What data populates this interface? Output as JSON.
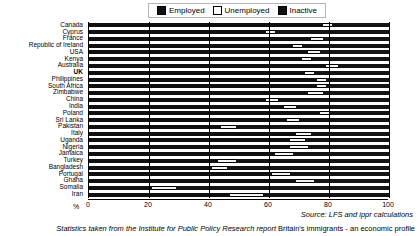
{
  "legend": {
    "entries": [
      {
        "label": "Employed",
        "color": "#101010",
        "key": "employed"
      },
      {
        "label": "Unemployed",
        "color": "#f2f2f2",
        "key": "unemployed"
      },
      {
        "label": "Inactive",
        "color": "#141414",
        "key": "inactive"
      }
    ]
  },
  "axis": {
    "x_ticks": [
      "0",
      "20",
      "40",
      "60",
      "80",
      "100"
    ],
    "x_unit_label": "%",
    "xlim": [
      0,
      100
    ]
  },
  "source_note": "Source: LFS and ippr calculations",
  "caption": {
    "prefix": "Statistics taken from the Institute for Public Policy Research report ",
    "report_title": "Britain's immigrants - an economic profile"
  },
  "chart_data": {
    "type": "bar",
    "orientation": "horizontal",
    "stacked": true,
    "title": "",
    "xlabel": "%",
    "ylabel": "",
    "xlim": [
      0,
      100
    ],
    "grid": true,
    "grid_axis": "x",
    "legend_position": "top",
    "series": [
      {
        "name": "Employed",
        "color": "#101010"
      },
      {
        "name": "Unemployed",
        "color": "#f2f2f2"
      },
      {
        "name": "Inactive",
        "color": "#141414"
      }
    ],
    "categories": [
      "Canada",
      "Cyprus",
      "France",
      "Republic of Ireland",
      "USA",
      "Kenya",
      "Australia",
      "UK",
      "Philippines",
      "South Africa",
      "Zimbabwe",
      "China",
      "India",
      "Poland",
      "Sri Lanka",
      "Pakistan",
      "Italy",
      "Uganda",
      "Nigeria",
      "Jamaica",
      "Turkey",
      "Bangladesh",
      "Portugal",
      "Ghana",
      "Somalia",
      "Iran"
    ],
    "highlighted_category": "UK",
    "rows": [
      {
        "country": "Canada",
        "employed": 78,
        "unemployed": 3,
        "inactive": 19
      },
      {
        "country": "Cyprus",
        "employed": 59,
        "unemployed": 3,
        "inactive": 38
      },
      {
        "country": "France",
        "employed": 74,
        "unemployed": 4,
        "inactive": 22
      },
      {
        "country": "Republic of Ireland",
        "employed": 68,
        "unemployed": 3,
        "inactive": 29
      },
      {
        "country": "USA",
        "employed": 73,
        "unemployed": 4,
        "inactive": 23
      },
      {
        "country": "Kenya",
        "employed": 71,
        "unemployed": 3,
        "inactive": 26
      },
      {
        "country": "Australia",
        "employed": 79,
        "unemployed": 4,
        "inactive": 17
      },
      {
        "country": "UK",
        "employed": 72,
        "unemployed": 3,
        "inactive": 25
      },
      {
        "country": "Philippines",
        "employed": 76,
        "unemployed": 3,
        "inactive": 21
      },
      {
        "country": "South Africa",
        "employed": 76,
        "unemployed": 3,
        "inactive": 21
      },
      {
        "country": "Zimbabwe",
        "employed": 73,
        "unemployed": 5,
        "inactive": 22
      },
      {
        "country": "China",
        "employed": 59,
        "unemployed": 4,
        "inactive": 37
      },
      {
        "country": "India",
        "employed": 65,
        "unemployed": 4,
        "inactive": 31
      },
      {
        "country": "Poland",
        "employed": 77,
        "unemployed": 3,
        "inactive": 20
      },
      {
        "country": "Sri Lanka",
        "employed": 66,
        "unemployed": 4,
        "inactive": 30
      },
      {
        "country": "Pakistan",
        "employed": 44,
        "unemployed": 5,
        "inactive": 51
      },
      {
        "country": "Italy",
        "employed": 69,
        "unemployed": 5,
        "inactive": 26
      },
      {
        "country": "Uganda",
        "employed": 67,
        "unemployed": 5,
        "inactive": 28
      },
      {
        "country": "Nigeria",
        "employed": 67,
        "unemployed": 6,
        "inactive": 27
      },
      {
        "country": "Jamaica",
        "employed": 62,
        "unemployed": 6,
        "inactive": 32
      },
      {
        "country": "Turkey",
        "employed": 43,
        "unemployed": 6,
        "inactive": 51
      },
      {
        "country": "Bangladesh",
        "employed": 41,
        "unemployed": 5,
        "inactive": 54
      },
      {
        "country": "Portugal",
        "employed": 61,
        "unemployed": 6,
        "inactive": 33
      },
      {
        "country": "Ghana",
        "employed": 69,
        "unemployed": 6,
        "inactive": 25
      },
      {
        "country": "Somalia",
        "employed": 21,
        "unemployed": 8,
        "inactive": 71
      },
      {
        "country": "Iran",
        "employed": 47,
        "unemployed": 11,
        "inactive": 42
      }
    ]
  }
}
